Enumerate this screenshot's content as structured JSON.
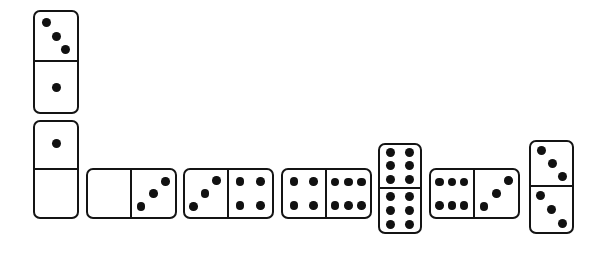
{
  "scene": {
    "title": "Domino chain layout",
    "width": 607,
    "height": 254,
    "background_color": "#ffffff",
    "pip_color": "#111111",
    "outline_color": "#141414",
    "description": "A chain of eight dominoes: two stacked vertically at the left, a horizontal row across the middle, a vertical double-six near the right, and a vertical three-three at the far right."
  },
  "dominoes": [
    {
      "id": "domino-1",
      "name": "domino-3-1",
      "orientation": "vertical",
      "values": [
        3,
        1
      ],
      "label": "3-1",
      "x": 33,
      "y": 10,
      "w": 46,
      "h": 104,
      "pip_layouts": [
        "diag-main-3",
        "center-1"
      ],
      "halves": [
        {
          "value": 3,
          "pips": [
            [
              28,
              22
            ],
            [
              50,
              50
            ],
            [
              72,
              78
            ]
          ]
        },
        {
          "value": 1,
          "pips": [
            [
              50,
              50
            ]
          ]
        }
      ]
    },
    {
      "id": "domino-2",
      "name": "domino-1-blank",
      "orientation": "vertical",
      "values": [
        1,
        0
      ],
      "label": "1-0",
      "x": 33,
      "y": 120,
      "w": 46,
      "h": 99,
      "pip_layouts": [
        "center-1",
        "blank"
      ],
      "halves": [
        {
          "value": 1,
          "pips": [
            [
              50,
              48
            ]
          ]
        },
        {
          "value": 0,
          "pips": []
        }
      ]
    },
    {
      "id": "domino-3",
      "name": "domino-blank-3",
      "orientation": "horizontal",
      "values": [
        0,
        3
      ],
      "label": "0-3",
      "x": 86,
      "y": 168,
      "w": 91,
      "h": 51,
      "pip_layouts": [
        "blank",
        "diag-anti-3"
      ],
      "halves": [
        {
          "value": 0,
          "pips": []
        },
        {
          "value": 3,
          "pips": [
            [
              78,
              24
            ],
            [
              50,
              50
            ],
            [
              22,
              78
            ]
          ]
        }
      ]
    },
    {
      "id": "domino-4",
      "name": "domino-3-4",
      "orientation": "horizontal",
      "values": [
        3,
        4
      ],
      "label": "3-4",
      "x": 183,
      "y": 168,
      "w": 91,
      "h": 51,
      "pip_layouts": [
        "diag-anti-3",
        "corners-4"
      ],
      "halves": [
        {
          "value": 3,
          "pips": [
            [
              76,
              22
            ],
            [
              48,
              50
            ],
            [
              20,
              78
            ]
          ]
        },
        {
          "value": 4,
          "pips": [
            [
              26,
              24
            ],
            [
              74,
              24
            ],
            [
              26,
              76
            ],
            [
              74,
              76
            ]
          ]
        }
      ]
    },
    {
      "id": "domino-5",
      "name": "domino-4-6",
      "orientation": "horizontal",
      "values": [
        4,
        6
      ],
      "label": "4-6",
      "x": 281,
      "y": 168,
      "w": 91,
      "h": 51,
      "pip_layouts": [
        "corners-4",
        "six-3x2"
      ],
      "halves": [
        {
          "value": 4,
          "pips": [
            [
              26,
              24
            ],
            [
              74,
              24
            ],
            [
              26,
              76
            ],
            [
              74,
              76
            ]
          ]
        },
        {
          "value": 6,
          "pips": [
            [
              20,
              26
            ],
            [
              50,
              26
            ],
            [
              80,
              26
            ],
            [
              20,
              76
            ],
            [
              50,
              76
            ],
            [
              80,
              76
            ]
          ]
        }
      ]
    },
    {
      "id": "domino-6",
      "name": "domino-6-6-double",
      "orientation": "vertical",
      "values": [
        6,
        6
      ],
      "label": "6-6",
      "x": 378,
      "y": 143,
      "w": 44,
      "h": 91,
      "pip_layouts": [
        "six-2x3",
        "six-2x3"
      ],
      "halves": [
        {
          "value": 6,
          "pips": [
            [
              26,
              18
            ],
            [
              74,
              18
            ],
            [
              26,
              50
            ],
            [
              74,
              50
            ],
            [
              26,
              82
            ],
            [
              74,
              82
            ]
          ]
        },
        {
          "value": 6,
          "pips": [
            [
              26,
              18
            ],
            [
              74,
              18
            ],
            [
              26,
              50
            ],
            [
              74,
              50
            ],
            [
              26,
              82
            ],
            [
              74,
              82
            ]
          ]
        }
      ]
    },
    {
      "id": "domino-7",
      "name": "domino-6-3",
      "orientation": "horizontal",
      "values": [
        6,
        3
      ],
      "label": "6-3",
      "x": 429,
      "y": 168,
      "w": 91,
      "h": 51,
      "pip_layouts": [
        "six-3x2",
        "diag-anti-3"
      ],
      "halves": [
        {
          "value": 6,
          "pips": [
            [
              20,
              26
            ],
            [
              50,
              26
            ],
            [
              80,
              26
            ],
            [
              20,
              76
            ],
            [
              50,
              76
            ],
            [
              80,
              76
            ]
          ]
        },
        {
          "value": 3,
          "pips": [
            [
              78,
              22
            ],
            [
              50,
              50
            ],
            [
              22,
              78
            ]
          ]
        }
      ]
    },
    {
      "id": "domino-8",
      "name": "domino-3-3-double",
      "orientation": "vertical",
      "values": [
        3,
        3
      ],
      "label": "3-3",
      "x": 529,
      "y": 140,
      "w": 45,
      "h": 94,
      "pip_layouts": [
        "diag-main-3",
        "diag-main-3"
      ],
      "halves": [
        {
          "value": 3,
          "pips": [
            [
              26,
              20
            ],
            [
              52,
              50
            ],
            [
              78,
              80
            ]
          ]
        },
        {
          "value": 3,
          "pips": [
            [
              24,
              18
            ],
            [
              50,
              50
            ],
            [
              78,
              82
            ]
          ]
        }
      ]
    }
  ]
}
